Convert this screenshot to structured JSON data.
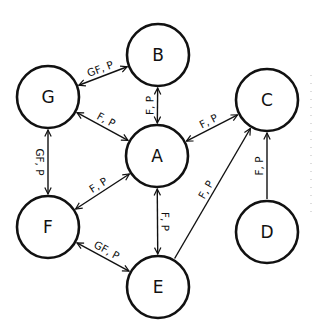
{
  "diagram": {
    "type": "directed-graph",
    "nodes": [
      {
        "id": "G",
        "label": "G",
        "x": 48,
        "y": 97
      },
      {
        "id": "B",
        "label": "B",
        "x": 158,
        "y": 55
      },
      {
        "id": "C",
        "label": "C",
        "x": 267,
        "y": 100
      },
      {
        "id": "A",
        "label": "A",
        "x": 157,
        "y": 156
      },
      {
        "id": "F",
        "label": "F",
        "x": 48,
        "y": 227
      },
      {
        "id": "E",
        "label": "E",
        "x": 158,
        "y": 287
      },
      {
        "id": "D",
        "label": "D",
        "x": 267,
        "y": 232
      }
    ],
    "node_radius": 31,
    "edges": [
      {
        "from": "G",
        "to": "B",
        "label": "GF, P",
        "bidirectional": true
      },
      {
        "from": "G",
        "to": "A",
        "label": "F, P",
        "bidirectional": true
      },
      {
        "from": "B",
        "to": "A",
        "label": "F, P",
        "bidirectional": true
      },
      {
        "from": "A",
        "to": "C",
        "label": "F, P",
        "bidirectional": true
      },
      {
        "from": "G",
        "to": "F",
        "label": "GF, P",
        "bidirectional": true
      },
      {
        "from": "F",
        "to": "A",
        "label": "F, P",
        "bidirectional": true
      },
      {
        "from": "F",
        "to": "E",
        "label": "GF, P",
        "bidirectional": true
      },
      {
        "from": "A",
        "to": "E",
        "label": "F, P",
        "bidirectional": true
      },
      {
        "from": "E",
        "to": "C",
        "label": "F, P",
        "bidirectional": false
      },
      {
        "from": "D",
        "to": "C",
        "label": "F, P",
        "bidirectional": false
      }
    ],
    "stroke_color": "#111111",
    "background": "#ffffff"
  }
}
